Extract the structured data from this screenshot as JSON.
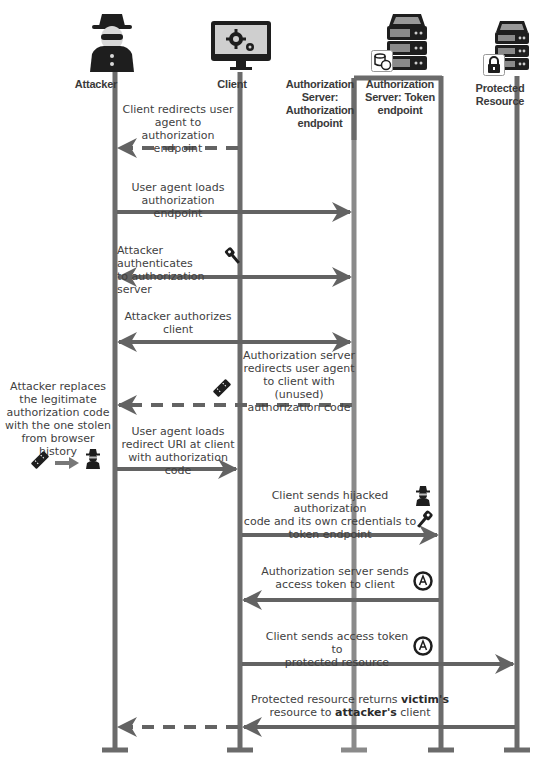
{
  "diagram": {
    "colors": {
      "lifeline": "#6b6b6b",
      "lifeline_light": "#8a8a8a",
      "arrow": "#636363",
      "text": "#3f3f3f",
      "icon": "#1e1e1e"
    },
    "actors": [
      {
        "id": "attacker",
        "label": "Attacker",
        "icon": "spy-icon"
      },
      {
        "id": "client",
        "label": "Client",
        "icon": "monitor-gears-icon"
      },
      {
        "id": "auth_endpoint",
        "label": "Authorization Server: Authorization endpoint",
        "lines": [
          "Authorization",
          "Server:",
          "Authorization",
          "endpoint"
        ],
        "icon": "server-icon"
      },
      {
        "id": "token_endpoint",
        "label": "Authorization Server: Token endpoint",
        "lines": [
          "Authorization",
          "Server: Token",
          "endpoint"
        ],
        "icon": "server-database-icon"
      },
      {
        "id": "protected_resource",
        "label": "Protected Resource",
        "lines": [
          "Protected",
          "Resource"
        ],
        "icon": "server-lock-icon"
      }
    ],
    "messages": [
      {
        "step": 1,
        "from": "client",
        "to": "attacker",
        "style": "dashed",
        "text": "Client redirects user agent to authorization endpoint",
        "lines": [
          "Client redirects user",
          "agent to authorization",
          "endpoint"
        ]
      },
      {
        "step": 2,
        "from": "attacker",
        "to": "auth_endpoint",
        "style": "solid",
        "text": "User agent loads authorization endpoint",
        "lines": [
          "User agent loads",
          "authorization endpoint"
        ]
      },
      {
        "step": 3,
        "from": "attacker",
        "to": "auth_endpoint",
        "style": "bidirectional",
        "text": "Attacker authenticates to authorization server",
        "lines": [
          "Attacker authenticates",
          "to authorization server"
        ],
        "icon": "key-icon"
      },
      {
        "step": 4,
        "from": "attacker",
        "to": "auth_endpoint",
        "style": "bidirectional",
        "text": "Attacker authorizes client",
        "lines": [
          "Attacker authorizes",
          "client"
        ]
      },
      {
        "step": 5,
        "from": "auth_endpoint",
        "to": "attacker",
        "style": "dashed",
        "text": "Authorization server redirects user agent to client with (unused) authorization code",
        "lines": [
          "Authorization server",
          "redirects user agent",
          "to client with (unused)",
          "authorization code"
        ],
        "icon": "ticket-icon"
      },
      {
        "step": 6,
        "from": "attacker",
        "to": "client",
        "style": "solid",
        "text": "User agent loads redirect URI at client with authorization code",
        "lines": [
          "User agent loads",
          "redirect URI at client",
          "with authorization code"
        ]
      },
      {
        "step": 7,
        "from": "client",
        "to": "token_endpoint",
        "style": "solid",
        "text": "Client sends hijacked authorization code and its own credentials to token endpoint",
        "lines": [
          "Client sends hijacked authorization",
          "code and its own credentials to",
          "token endpoint"
        ],
        "icons": [
          "spy-icon",
          "key-icon"
        ]
      },
      {
        "step": 8,
        "from": "token_endpoint",
        "to": "client",
        "style": "solid",
        "text": "Authorization server sends access token to client",
        "lines": [
          "Authorization server sends",
          "access token to client"
        ],
        "icon": "access-token-icon"
      },
      {
        "step": 9,
        "from": "client",
        "to": "protected_resource",
        "style": "solid",
        "text": "Client sends access token to protected resource",
        "lines": [
          "Client sends access token to",
          "protected resource"
        ],
        "icon": "access-token-icon"
      },
      {
        "step": 10,
        "from": "protected_resource",
        "to": "attacker",
        "style": "solid-then-dashed",
        "line1_pre": "Protected resource returns ",
        "line1_bold": "victim's",
        "line2_pre": "resource to ",
        "line2_bold": "attacker's",
        "line2_post": " client"
      }
    ],
    "side_note": {
      "lines": [
        "Attacker replaces",
        "the legitimate",
        "authorization code",
        "with the one stolen",
        "from browser history"
      ],
      "icons": [
        "ticket-icon",
        "arrow-right-icon",
        "spy-icon"
      ]
    }
  }
}
